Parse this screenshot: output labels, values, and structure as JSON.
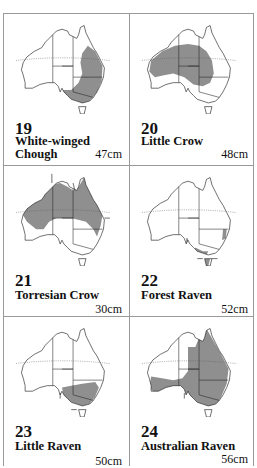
{
  "colors": {
    "range_fill": "#8f8f8f",
    "outline": "#222222",
    "border": "#9a9a9a",
    "tropic_line": "#555555"
  },
  "species": [
    {
      "number": "19",
      "name": "White-winged Chough",
      "size": "47cm",
      "range": [
        [
          [
            78,
            22
          ],
          [
            86,
            28
          ],
          [
            94,
            44
          ],
          [
            93,
            60
          ],
          [
            88,
            72
          ],
          [
            80,
            82
          ],
          [
            70,
            86
          ],
          [
            60,
            82
          ],
          [
            52,
            78
          ],
          [
            50,
            70
          ],
          [
            60,
            70
          ],
          [
            68,
            62
          ],
          [
            72,
            52
          ],
          [
            70,
            40
          ],
          [
            72,
            30
          ]
        ]
      ],
      "arrows": []
    },
    {
      "number": "20",
      "name": "Little Crow",
      "size": "48cm",
      "range": [
        [
          [
            10,
            38
          ],
          [
            22,
            28
          ],
          [
            36,
            22
          ],
          [
            50,
            20
          ],
          [
            62,
            22
          ],
          [
            70,
            28
          ],
          [
            76,
            38
          ],
          [
            78,
            52
          ],
          [
            74,
            62
          ],
          [
            66,
            66
          ],
          [
            56,
            64
          ],
          [
            46,
            56
          ],
          [
            34,
            52
          ],
          [
            24,
            54
          ],
          [
            14,
            56
          ],
          [
            8,
            50
          ]
        ]
      ],
      "arrows": []
    },
    {
      "number": "21",
      "name": "Torresian Crow",
      "size": "30cm",
      "range": [
        [
          [
            6,
            38
          ],
          [
            16,
            28
          ],
          [
            28,
            20
          ],
          [
            36,
            8
          ],
          [
            48,
            6
          ],
          [
            56,
            10
          ],
          [
            62,
            14
          ],
          [
            68,
            10
          ],
          [
            74,
            0
          ],
          [
            80,
            12
          ],
          [
            88,
            26
          ],
          [
            94,
            40
          ],
          [
            92,
            52
          ],
          [
            88,
            64
          ],
          [
            84,
            56
          ],
          [
            76,
            48
          ],
          [
            60,
            44
          ],
          [
            44,
            44
          ],
          [
            36,
            48
          ],
          [
            30,
            56
          ],
          [
            22,
            56
          ],
          [
            12,
            48
          ]
        ]
      ],
      "arrows": [
        [
          39,
          -4,
          39,
          6
        ],
        [
          62,
          6,
          64,
          14
        ],
        [
          96,
          44,
          102,
          44
        ]
      ]
    },
    {
      "number": "22",
      "name": "Forest Raven",
      "size": "52cm",
      "range": [
        [
          [
            88,
            56
          ],
          [
            92,
            56
          ],
          [
            91,
            66
          ],
          [
            87,
            68
          ]
        ],
        [
          [
            58,
            76
          ],
          [
            66,
            80
          ],
          [
            72,
            80
          ],
          [
            70,
            84
          ],
          [
            62,
            84
          ],
          [
            56,
            80
          ]
        ],
        [
          [
            68,
            88
          ],
          [
            74,
            88
          ],
          [
            72,
            96
          ],
          [
            68,
            96
          ]
        ],
        [
          [
            48,
            66
          ],
          [
            50,
            66
          ],
          [
            50,
            72
          ],
          [
            48,
            72
          ]
        ]
      ],
      "arrows": [
        [
          60,
          88,
          66,
          88
        ],
        [
          82,
          88,
          76,
          88
        ]
      ]
    },
    {
      "number": "23",
      "name": "Little Raven",
      "size": "50cm",
      "range": [
        [
          [
            50,
            64
          ],
          [
            60,
            62
          ],
          [
            72,
            60
          ],
          [
            86,
            58
          ],
          [
            90,
            64
          ],
          [
            86,
            74
          ],
          [
            80,
            82
          ],
          [
            72,
            84
          ],
          [
            64,
            82
          ],
          [
            56,
            78
          ],
          [
            52,
            74
          ]
        ]
      ],
      "arrows": [
        [
          48,
          76,
          48,
          70
        ],
        [
          60,
          88,
          66,
          88
        ]
      ]
    },
    {
      "number": "24",
      "name": "Australian Raven",
      "size": "56cm",
      "range": [
        [
          [
            50,
            20
          ],
          [
            58,
            20
          ],
          [
            62,
            10
          ],
          [
            70,
            0
          ],
          [
            78,
            14
          ],
          [
            86,
            28
          ],
          [
            94,
            44
          ],
          [
            92,
            60
          ],
          [
            86,
            74
          ],
          [
            80,
            84
          ],
          [
            70,
            86
          ],
          [
            60,
            82
          ],
          [
            56,
            78
          ],
          [
            52,
            74
          ],
          [
            46,
            70
          ],
          [
            40,
            66
          ],
          [
            34,
            64
          ],
          [
            24,
            66
          ],
          [
            14,
            70
          ],
          [
            8,
            64
          ],
          [
            10,
            52
          ],
          [
            22,
            54
          ],
          [
            34,
            56
          ],
          [
            44,
            54
          ],
          [
            50,
            46
          ]
        ]
      ],
      "arrows": [
        [
          46,
          76,
          46,
          70
        ]
      ]
    }
  ]
}
